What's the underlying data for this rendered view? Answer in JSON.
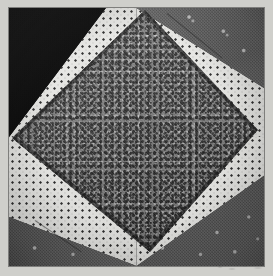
{
  "image": {
    "kind": "photograph",
    "subject": "quilt-block",
    "pattern_name": "Square in a Square",
    "alt_text": "Photograph of a pieced quilt block: a large gray mottled diamond set on point inside a square, with four corner triangles of white pin-dot, dark floral and solid black fabric.",
    "width_px": 273,
    "height_px": 276
  },
  "scan": {
    "margin_color": "#cfcfcb",
    "margin_label": "scan-margin",
    "marks_label": "faint smudge marks"
  },
  "block": {
    "label": "quilt block photograph",
    "frame_color": "#6d6d6d",
    "left_px": 9,
    "top_px": 8,
    "width_px": 255,
    "height_px": 258
  },
  "fabrics": [
    {
      "id": "pin-dot-white",
      "label": "White pin-dot cotton",
      "ground_color": "#ededea",
      "motif_color": "#2b2b2b",
      "motif": "regular grid of small dark dots",
      "dot_spacing_px": 7
    },
    {
      "id": "solid-black",
      "label": "Solid black cotton",
      "ground_color": "#0d0d0d",
      "motif_color": "#0d0d0d",
      "motif": "plain solid",
      "dot_spacing_px": 0
    },
    {
      "id": "dark-floral",
      "label": "Dark gray floral print",
      "ground_color": "#575757",
      "motif_color": "#e6e6e6",
      "motif": "scattered small light flower sprigs",
      "dot_spacing_px": 0
    },
    {
      "id": "gray-mottle",
      "label": "Medium gray mottled print",
      "ground_color": "#7b7b7b",
      "motif_color": "#262626",
      "motif": "dense random speckle",
      "dot_spacing_px": 0
    }
  ],
  "patches": {
    "center_diamond": {
      "label": "center diamond on point",
      "fabric": "gray-mottle",
      "vertices_pct": [
        {
          "x": 53.3,
          "y": 0.8
        },
        {
          "x": 97.6,
          "y": 47.3
        },
        {
          "x": 55.3,
          "y": 94.6
        },
        {
          "x": 1.2,
          "y": 50.4
        }
      ]
    },
    "corners": [
      {
        "position": "top-left",
        "label": "top-left corner",
        "pieces": [
          {
            "label": "black corner triangle",
            "fabric": "solid-black"
          },
          {
            "label": "white pin-dot triangle",
            "fabric": "pin-dot-white"
          }
        ]
      },
      {
        "position": "top-right",
        "label": "top-right corner",
        "pieces": [
          {
            "label": "dark floral triangle",
            "fabric": "dark-floral"
          },
          {
            "label": "white pin-dot triangle",
            "fabric": "pin-dot-white"
          }
        ]
      },
      {
        "position": "bottom-left",
        "label": "bottom-left corner",
        "pieces": [
          {
            "label": "white pin-dot triangle",
            "fabric": "pin-dot-white"
          },
          {
            "label": "dark floral triangle",
            "fabric": "dark-floral"
          }
        ]
      },
      {
        "position": "bottom-right",
        "label": "bottom-right corner",
        "pieces": [
          {
            "label": "dark floral triangle",
            "fabric": "dark-floral"
          },
          {
            "label": "white pin-dot triangle",
            "fabric": "pin-dot-white"
          }
        ]
      }
    ]
  },
  "seams": {
    "diamond_outline_label": "diamond seam line",
    "top_right_label": "top-right piecing seam",
    "bottom_left_label": "bottom-left piecing seam",
    "color": "#141414"
  }
}
